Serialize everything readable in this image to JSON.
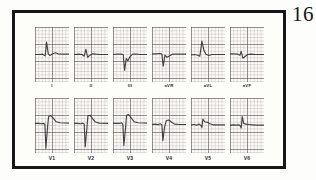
{
  "figure": {
    "number": "16",
    "caption": "",
    "border_color": "#17171a",
    "paper_color": "#fdfdfa",
    "trace_color": "#2b2b30",
    "grid_color": "#968c8c"
  },
  "chart_data": {
    "type": "line",
    "title": "",
    "subtitle": "",
    "xlabel": "",
    "ylabel": "",
    "grid": true,
    "legend_position": "none",
    "layout": {
      "rows": 2,
      "columns": 6
    },
    "panel_axes": {
      "x_units": "small squares (0.04 s each)",
      "y_units": "small squares (0.1 mV each)",
      "xlim": [
        0,
        10
      ],
      "ylim": [
        -8,
        8
      ],
      "baseline_row": "center"
    },
    "series": [
      {
        "name": "I",
        "row": 0,
        "column": 0,
        "label": "I",
        "morphology": "small q, tall R, ST segment slightly elevated, upright T",
        "points": [
          [
            0,
            0
          ],
          [
            1.1,
            0
          ],
          [
            2.2,
            0.1
          ],
          [
            3.0,
            -0.4
          ],
          [
            3.4,
            3.6
          ],
          [
            3.9,
            0.2
          ],
          [
            4.4,
            -0.3
          ],
          [
            5.2,
            0.2
          ],
          [
            6.0,
            0.5
          ],
          [
            6.8,
            0.2
          ],
          [
            8.0,
            0.1
          ],
          [
            10,
            0.1
          ]
        ]
      },
      {
        "name": "II",
        "row": 0,
        "column": 1,
        "label": "II",
        "morphology": "low amplitude rS, flat ST, shallow T",
        "points": [
          [
            0,
            0
          ],
          [
            1.4,
            0.1
          ],
          [
            2.4,
            0.0
          ],
          [
            3.0,
            -0.5
          ],
          [
            3.5,
            1.5
          ],
          [
            4.0,
            -0.8
          ],
          [
            4.6,
            -0.3
          ],
          [
            5.5,
            0.2
          ],
          [
            6.4,
            0.1
          ],
          [
            7.6,
            0.0
          ],
          [
            10,
            0.0
          ]
        ]
      },
      {
        "name": "III",
        "row": 0,
        "column": 2,
        "label": "III",
        "morphology": "deep QS complex, negative deflection, inverted T",
        "points": [
          [
            0,
            0
          ],
          [
            1.3,
            0.1
          ],
          [
            2.5,
            0.1
          ],
          [
            3.0,
            0.0
          ],
          [
            3.4,
            -4.6
          ],
          [
            3.9,
            -1.2
          ],
          [
            4.4,
            -1.8
          ],
          [
            5.0,
            -0.6
          ],
          [
            5.8,
            0.1
          ],
          [
            6.8,
            0.1
          ],
          [
            8.0,
            0.0
          ],
          [
            10,
            0.0
          ]
        ]
      },
      {
        "name": "aVR",
        "row": 0,
        "column": 3,
        "label": "aVR",
        "morphology": "negative QS deflection, inverted complex",
        "points": [
          [
            0,
            0.2
          ],
          [
            1.2,
            0.2
          ],
          [
            2.3,
            0.3
          ],
          [
            2.9,
            0.1
          ],
          [
            3.3,
            -3.4
          ],
          [
            3.8,
            -0.2
          ],
          [
            4.4,
            -0.8
          ],
          [
            5.1,
            -0.4
          ],
          [
            6.0,
            0.1
          ],
          [
            7.2,
            0.1
          ],
          [
            8.4,
            0.1
          ],
          [
            10,
            0.1
          ]
        ]
      },
      {
        "name": "aVL",
        "row": 0,
        "column": 4,
        "label": "aVL",
        "morphology": "tall R wave with ST elevation, dome shaped",
        "points": [
          [
            0,
            -0.1
          ],
          [
            1.0,
            0.0
          ],
          [
            2.0,
            -0.2
          ],
          [
            2.6,
            -0.5
          ],
          [
            3.2,
            3.9
          ],
          [
            3.8,
            1.2
          ],
          [
            4.4,
            0.1
          ],
          [
            5.2,
            -0.3
          ],
          [
            6.2,
            0.0
          ],
          [
            7.4,
            0.0
          ],
          [
            10,
            0.0
          ]
        ]
      },
      {
        "name": "aVF",
        "row": 0,
        "column": 5,
        "label": "aVF",
        "morphology": "low amplitude rS, near isoelectric",
        "points": [
          [
            0,
            0.2
          ],
          [
            1.2,
            0.2
          ],
          [
            2.3,
            0.1
          ],
          [
            2.9,
            -0.2
          ],
          [
            3.3,
            0.9
          ],
          [
            3.8,
            -1.1
          ],
          [
            4.4,
            -0.6
          ],
          [
            5.2,
            0.0
          ],
          [
            6.2,
            0.1
          ],
          [
            7.5,
            0.0
          ],
          [
            10,
            0.0
          ]
        ]
      },
      {
        "name": "V1",
        "row": 1,
        "column": 0,
        "label": "V1",
        "morphology": "deep QS complex with marked ST elevation and tall T wave",
        "points": [
          [
            0,
            0.6
          ],
          [
            1.0,
            0.6
          ],
          [
            1.9,
            0.5
          ],
          [
            2.5,
            0.6
          ],
          [
            2.9,
            0.4
          ],
          [
            3.2,
            -6.6
          ],
          [
            3.7,
            -0.4
          ],
          [
            4.0,
            2.6
          ],
          [
            4.6,
            2.9
          ],
          [
            5.3,
            2.2
          ],
          [
            6.2,
            1.1
          ],
          [
            7.4,
            0.8
          ],
          [
            10,
            0.7
          ]
        ]
      },
      {
        "name": "V2",
        "row": 1,
        "column": 1,
        "label": "V2",
        "morphology": "deep QS complex with marked ST elevation and tall T wave",
        "points": [
          [
            0,
            0.6
          ],
          [
            1.1,
            0.6
          ],
          [
            2.0,
            0.5
          ],
          [
            2.6,
            0.7
          ],
          [
            3.0,
            0.4
          ],
          [
            3.3,
            -6.2
          ],
          [
            3.8,
            -0.6
          ],
          [
            4.1,
            2.8
          ],
          [
            4.7,
            3.0
          ],
          [
            5.4,
            2.1
          ],
          [
            6.3,
            1.0
          ],
          [
            7.5,
            0.7
          ],
          [
            10,
            0.6
          ]
        ]
      },
      {
        "name": "V3",
        "row": 1,
        "column": 2,
        "label": "V3",
        "morphology": "deep QS complex with marked ST elevation and tall T wave",
        "points": [
          [
            0,
            0.7
          ],
          [
            1.0,
            0.6
          ],
          [
            1.9,
            0.6
          ],
          [
            2.5,
            0.8
          ],
          [
            2.9,
            0.3
          ],
          [
            3.2,
            -5.8
          ],
          [
            3.7,
            -0.5
          ],
          [
            4.0,
            3.0
          ],
          [
            4.6,
            3.2
          ],
          [
            5.3,
            2.3
          ],
          [
            6.2,
            1.1
          ],
          [
            7.4,
            0.8
          ],
          [
            10,
            0.7
          ]
        ]
      },
      {
        "name": "V4",
        "row": 1,
        "column": 3,
        "label": "V4",
        "morphology": "QS complex with ST elevation and rounded T wave",
        "points": [
          [
            0,
            0.3
          ],
          [
            1.0,
            0.4
          ],
          [
            1.8,
            0.2
          ],
          [
            2.4,
            0.5
          ],
          [
            2.9,
            0.2
          ],
          [
            3.2,
            -4.4
          ],
          [
            3.7,
            -0.4
          ],
          [
            4.2,
            1.4
          ],
          [
            4.9,
            1.6
          ],
          [
            5.7,
            1.0
          ],
          [
            6.6,
            0.4
          ],
          [
            7.8,
            0.3
          ],
          [
            10,
            0.3
          ]
        ]
      },
      {
        "name": "V5",
        "row": 1,
        "column": 4,
        "label": "V5",
        "morphology": "small R wave with ST elevation, coved T wave",
        "points": [
          [
            0,
            0.2
          ],
          [
            0.9,
            0.3
          ],
          [
            1.7,
            0.1
          ],
          [
            2.4,
            0.4
          ],
          [
            2.9,
            0.0
          ],
          [
            3.2,
            -0.6
          ],
          [
            3.5,
            1.9
          ],
          [
            4.0,
            1.1
          ],
          [
            4.7,
            1.0
          ],
          [
            5.5,
            0.5
          ],
          [
            6.5,
            0.2
          ],
          [
            7.8,
            0.2
          ],
          [
            10,
            0.2
          ]
        ]
      },
      {
        "name": "V6",
        "row": 1,
        "column": 5,
        "label": "V6",
        "morphology": "small R wave with ST elevation, narrow peaked complex",
        "points": [
          [
            0,
            0.1
          ],
          [
            1.0,
            0.2
          ],
          [
            1.9,
            0.1
          ],
          [
            2.6,
            0.2
          ],
          [
            3.0,
            -0.1
          ],
          [
            3.3,
            -0.7
          ],
          [
            3.6,
            2.6
          ],
          [
            4.0,
            0.6
          ],
          [
            4.7,
            0.4
          ],
          [
            5.6,
            0.3
          ],
          [
            6.6,
            0.2
          ],
          [
            7.8,
            0.1
          ],
          [
            10,
            0.1
          ]
        ]
      }
    ]
  }
}
